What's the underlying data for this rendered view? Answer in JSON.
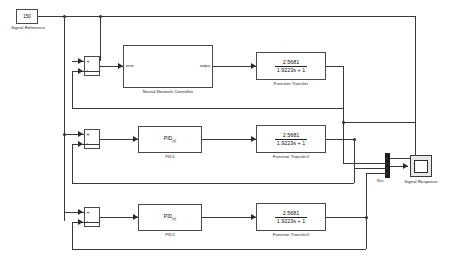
{
  "diagram": {
    "type": "simulink-block-diagram",
    "canvas": {
      "width": 451,
      "height": 263,
      "background": "#ffffff"
    },
    "line_color": "#3a3a3a"
  },
  "source": {
    "name": "signal-reference",
    "value": "150",
    "label": "Signal Reference"
  },
  "sum_blocks": [
    {
      "name": "sum-1",
      "label": "",
      "signs": [
        "+",
        "-"
      ]
    },
    {
      "name": "sum-2",
      "label": "",
      "signs": [
        "+",
        "-"
      ]
    },
    {
      "name": "sum-3",
      "label": "",
      "signs": [
        "+",
        "-"
      ]
    }
  ],
  "controllers": [
    {
      "name": "neural-network-controller",
      "kind": "subsystem",
      "label": "Neural Network Controller",
      "inport_label": "error",
      "outport_label": "output"
    },
    {
      "name": "pid-1",
      "kind": "pid",
      "label": "PID1",
      "body_main": "PID",
      "body_sub": "(s)"
    },
    {
      "name": "pid-2",
      "kind": "pid",
      "label": "PID2",
      "body_main": "PID",
      "body_sub": "(s)"
    }
  ],
  "transfer_functions": [
    {
      "name": "function-transfer",
      "label": "Function Transfer",
      "numerator": "2.5681",
      "denominator": "1.9223s + 1"
    },
    {
      "name": "function-transfer-1",
      "label": "Function Transfer1",
      "numerator": "2.5681",
      "denominator": "1.9223s + 1"
    },
    {
      "name": "function-transfer-2",
      "label": "Function Transfer2",
      "numerator": "2.5681",
      "denominator": "1.9223s + 1"
    }
  ],
  "mux": {
    "name": "mux-block",
    "label": "Mux",
    "input_count": 4
  },
  "scope": {
    "name": "signal-response-scope",
    "label": "Signal Response"
  }
}
